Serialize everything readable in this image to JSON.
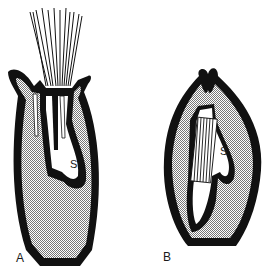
{
  "figure": {
    "panels": [
      {
        "id": "A",
        "label": "A",
        "inner_label": "S",
        "description": "Longitudinal section of flower with pappus bristles emerging from top"
      },
      {
        "id": "B",
        "label": "B",
        "inner_label": "S",
        "description": "Longitudinal section of closed ovoid structure with enclosed striated body"
      }
    ],
    "colors": {
      "outline": "#111111",
      "stipple": "#9a9a9a",
      "background": "#ffffff"
    }
  }
}
